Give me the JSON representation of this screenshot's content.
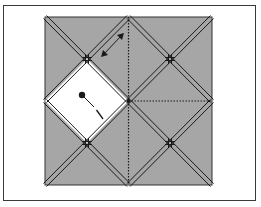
{
  "diagram": {
    "type": "origami-fold-diagram",
    "colors": {
      "paper": "#a6a6a6",
      "flap": "#ffffff",
      "line": "#1a1a1a",
      "frame": "#3a3a3a",
      "background": "#ffffff"
    },
    "square": {
      "x": 45,
      "y": 17,
      "size": 167
    },
    "elements": {
      "white_flap": "diamond flap",
      "arrow": "double-headed arrow",
      "pivot_dot": "dot with dashed line",
      "valley_fold_vertical": "dotted vertical line",
      "valley_fold_horizontal": "dotted horizontal line"
    }
  }
}
